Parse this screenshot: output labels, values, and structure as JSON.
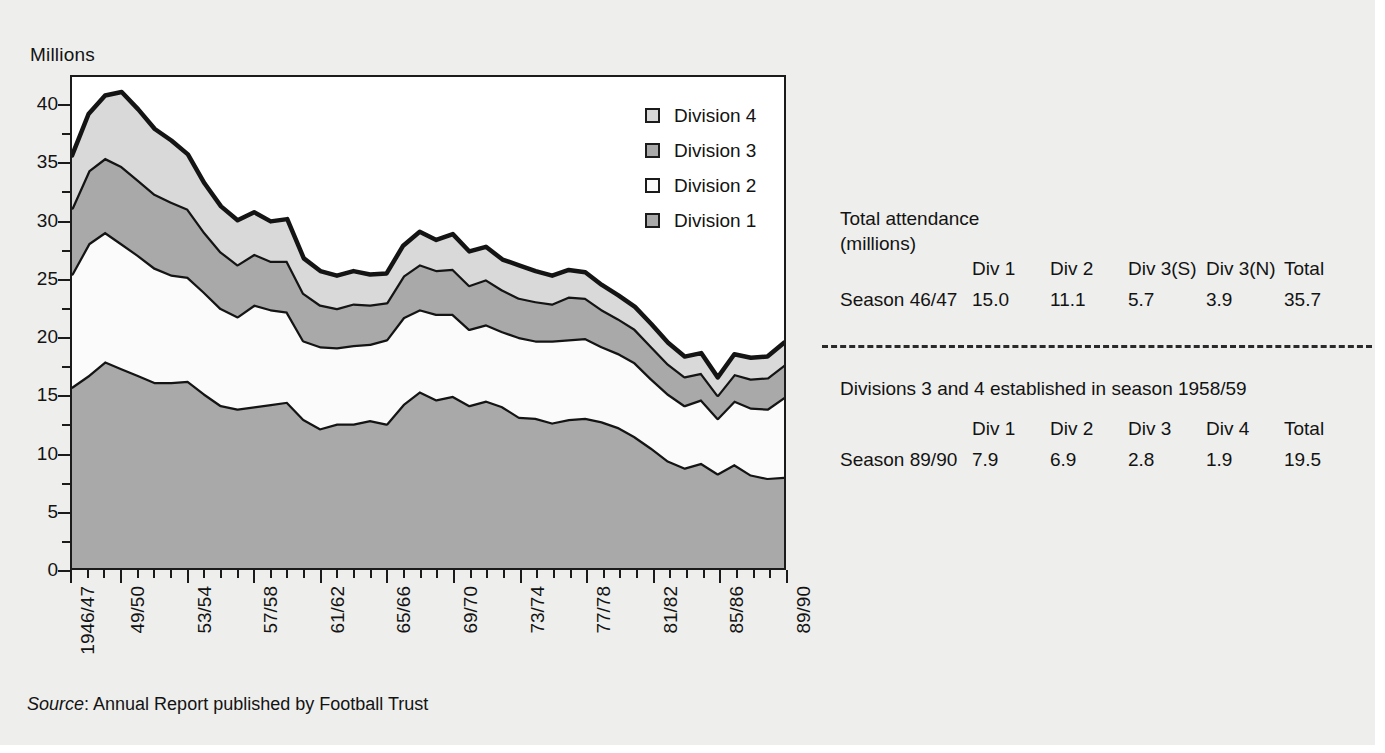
{
  "axis": {
    "y_title": "Millions",
    "y_ticks": [
      0,
      5,
      10,
      15,
      20,
      25,
      30,
      35,
      40
    ],
    "y_min": 0,
    "y_max": 42.5,
    "x_labels": [
      "1946/47",
      "49/50",
      "53/54",
      "57/58",
      "61/62",
      "65/66",
      "69/70",
      "73/74",
      "77/78",
      "81/82",
      "85/86",
      "89/90"
    ]
  },
  "legend": {
    "items": [
      {
        "label": "Division 4",
        "color": "#d9d9d9"
      },
      {
        "label": "Division 3",
        "color": "#a9a9a9"
      },
      {
        "label": "Division 2",
        "color": "#fbfbfb"
      },
      {
        "label": "Division 1",
        "color": "#a9a9a9"
      }
    ]
  },
  "source": {
    "word": "Source",
    "text": ": Annual Report published by Football Trust"
  },
  "tables": {
    "title_line1": "Total attendance",
    "title_line2": "(millions)",
    "note": "Divisions 3 and 4 established in season 1958/59",
    "first": {
      "headers": [
        "",
        "Div 1",
        "Div 2",
        "Div 3(S)",
        "Div 3(N)",
        "Total"
      ],
      "row": [
        "Season 46/47",
        "15.0",
        "11.1",
        "5.7",
        "3.9",
        "35.7"
      ]
    },
    "second": {
      "headers": [
        "",
        "Div 1",
        "Div 2",
        "Div 3",
        "Div 4",
        "Total"
      ],
      "row": [
        "Season 89/90",
        "7.9",
        "6.9",
        "2.8",
        "1.9",
        "19.5"
      ]
    }
  },
  "chart_data": {
    "type": "area",
    "title": "",
    "xlabel": "",
    "ylabel": "Millions",
    "ylim": [
      0,
      42.5
    ],
    "grid": false,
    "stacked": true,
    "legend_position": "inside-top-right",
    "x": [
      "1946/47",
      "47/48",
      "48/49",
      "49/50",
      "50/51",
      "51/52",
      "52/53",
      "53/54",
      "54/55",
      "55/56",
      "56/57",
      "57/58",
      "58/59",
      "59/60",
      "60/61",
      "61/62",
      "62/63",
      "63/64",
      "64/65",
      "65/66",
      "66/67",
      "67/68",
      "68/69",
      "69/70",
      "70/71",
      "71/72",
      "72/73",
      "73/74",
      "74/75",
      "75/76",
      "76/77",
      "77/78",
      "78/79",
      "79/80",
      "80/81",
      "81/82",
      "82/83",
      "83/84",
      "84/85",
      "85/86",
      "86/87",
      "87/88",
      "88/89",
      "89/90"
    ],
    "series": [
      {
        "name": "Division 1",
        "values": [
          15.7,
          16.7,
          17.9,
          17.3,
          16.7,
          16.1,
          16.1,
          16.2,
          15.1,
          14.1,
          13.8,
          14.0,
          14.2,
          14.4,
          12.9,
          12.1,
          12.5,
          12.5,
          12.8,
          12.5,
          14.2,
          15.3,
          14.6,
          14.9,
          14.1,
          14.5,
          14.0,
          13.1,
          13.0,
          12.6,
          12.9,
          13.0,
          12.7,
          12.2,
          11.4,
          10.4,
          9.3,
          8.7,
          9.1,
          8.2,
          9.0,
          8.1,
          7.8,
          7.9
        ]
      },
      {
        "name": "Division 2",
        "values": [
          9.8,
          11.4,
          11.2,
          10.8,
          10.4,
          9.9,
          9.3,
          9.0,
          8.8,
          8.4,
          8.0,
          8.8,
          8.2,
          7.8,
          6.8,
          7.1,
          6.6,
          6.8,
          6.6,
          7.3,
          7.5,
          7.1,
          7.4,
          7.1,
          6.6,
          6.6,
          6.5,
          6.9,
          6.7,
          7.1,
          6.9,
          6.9,
          6.5,
          6.4,
          6.4,
          6.0,
          5.8,
          5.4,
          5.5,
          4.8,
          5.5,
          5.8,
          6.0,
          6.9
        ]
      },
      {
        "name": "Division 3",
        "values": [
          5.7,
          6.3,
          6.4,
          6.7,
          6.5,
          6.4,
          6.3,
          5.9,
          5.2,
          4.9,
          4.5,
          4.4,
          4.2,
          4.4,
          4.1,
          3.6,
          3.4,
          3.6,
          3.4,
          3.2,
          3.6,
          3.9,
          3.8,
          3.9,
          3.8,
          3.9,
          3.6,
          3.4,
          3.4,
          3.2,
          3.7,
          3.5,
          3.2,
          3.0,
          2.9,
          2.8,
          2.6,
          2.5,
          2.3,
          2.0,
          2.3,
          2.5,
          2.7,
          2.8
        ]
      },
      {
        "name": "Division 4",
        "values": [
          4.5,
          4.9,
          5.4,
          6.4,
          6.1,
          5.6,
          5.3,
          4.7,
          4.2,
          3.9,
          3.8,
          3.6,
          3.4,
          3.6,
          3.0,
          2.9,
          2.8,
          2.8,
          2.6,
          2.5,
          2.6,
          2.8,
          2.6,
          3.0,
          2.9,
          2.8,
          2.6,
          2.8,
          2.6,
          2.4,
          2.3,
          2.2,
          2.1,
          2.0,
          1.9,
          1.9,
          1.8,
          1.7,
          1.7,
          1.5,
          1.7,
          1.8,
          1.8,
          1.9
        ]
      }
    ],
    "totals_note": "Stacked total peaks at about 41.5 million in 1949/50 and falls to about 19.5 million in 1989/90"
  }
}
